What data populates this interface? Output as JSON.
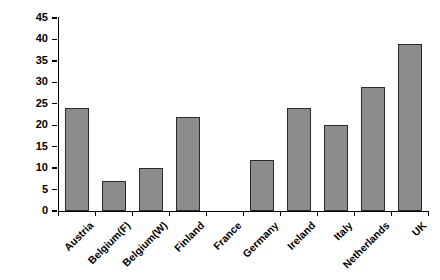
{
  "chart_data": {
    "type": "bar",
    "title": "",
    "xlabel": "",
    "ylabel": "Percentage",
    "categories": [
      "Austria",
      "Belgium(F)",
      "Belgium(W)",
      "Finland",
      "France",
      "Germany",
      "Ireland",
      "Italy",
      "Netherlands",
      "UK"
    ],
    "values": [
      24,
      7,
      10,
      22,
      0,
      12,
      24,
      20,
      29,
      39
    ],
    "ylim": [
      0,
      45
    ],
    "ytick_step": 5,
    "ytick_labels": [
      "0",
      "5",
      "10",
      "15",
      "20",
      "25",
      "30",
      "35",
      "40",
      "45"
    ],
    "grid": false,
    "legend": false,
    "bar_color": "#8c8c8c",
    "bar_border_color": "#2b2b2b",
    "axis_color": "#000000",
    "background_color": "#ffffff"
  }
}
